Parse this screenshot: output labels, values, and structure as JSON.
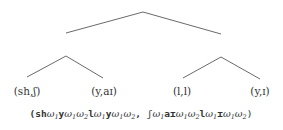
{
  "diagram": {
    "type": "tree",
    "root": {
      "apex": [
        143,
        12
      ],
      "children": [
        "left-subtree",
        "right-subtree"
      ]
    },
    "edges": [
      {
        "id": "root-left",
        "from": [
          143,
          12
        ],
        "to": [
          66,
          33
        ]
      },
      {
        "id": "root-right",
        "from": [
          143,
          12
        ],
        "to": [
          221,
          34
        ]
      },
      {
        "id": "left-sub-left",
        "from": [
          66,
          56
        ],
        "to": [
          27,
          77
        ]
      },
      {
        "id": "left-sub-right",
        "from": [
          66,
          56
        ],
        "to": [
          103,
          78
        ]
      },
      {
        "id": "right-sub-left",
        "from": [
          221,
          57
        ],
        "to": [
          183,
          78
        ]
      },
      {
        "id": "right-sub-right",
        "from": [
          221,
          57
        ],
        "to": [
          260,
          79
        ]
      }
    ],
    "leaves": [
      {
        "label": "(sh,ʃ)",
        "x": 27,
        "y": 85
      },
      {
        "label": "(y,aɪ)",
        "x": 104,
        "y": 85
      },
      {
        "label": "(l,l)",
        "x": 182,
        "y": 85
      },
      {
        "label": "(y,ɪ)",
        "x": 260,
        "y": 85
      }
    ],
    "expression": {
      "open": "(",
      "first": [
        {
          "t": "sh",
          "b": true
        },
        {
          "w": "1"
        },
        {
          "t": "y",
          "b": true
        },
        {
          "w": "1"
        },
        {
          "w": "2"
        },
        {
          "t": "l",
          "b": true
        },
        {
          "w": "1"
        },
        {
          "t": "y",
          "b": true
        },
        {
          "w": "1"
        },
        {
          "w": "2"
        }
      ],
      "separator": ", ",
      "second": [
        {
          "t": "ʃ",
          "b": false
        },
        {
          "w": "1"
        },
        {
          "t": "aɪ",
          "b": true
        },
        {
          "w": "1"
        },
        {
          "w": "2"
        },
        {
          "t": "l",
          "b": true
        },
        {
          "w": "1"
        },
        {
          "t": "ɪ",
          "b": true
        },
        {
          "w": "1"
        },
        {
          "w": "2"
        }
      ],
      "close": ")",
      "omega_symbol": "ω",
      "plain_text": "(shω₁yω₁ω₂lω₁yω₁ω₂, ʃω₁aɪω₁ω₂lω₁ɪω₁ω₂)"
    },
    "colors": {
      "edge": "#6a6a6a",
      "text": "#333333",
      "background": "#ffffff"
    }
  }
}
